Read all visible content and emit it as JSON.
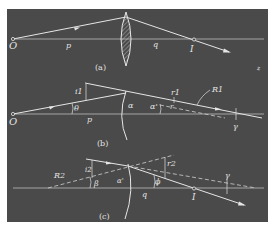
{
  "figure": {
    "background_color": "#4a4a4a",
    "page_color": "#ffffff",
    "line_color": "#e6e6e6",
    "panels": [
      {
        "id": "a",
        "caption": "(a)",
        "description": "Thin lens imaging an object point O to image point I on the optical axis",
        "labels": {
          "object": "O",
          "object_distance": "p",
          "image_distance": "q",
          "image": "I",
          "stray_mark": "z"
        }
      },
      {
        "id": "b",
        "caption": "(b)",
        "description": "Refraction at the first spherical surface of radius R1",
        "labels": {
          "object": "O",
          "object_distance": "p",
          "incidence_angle": "i1",
          "refraction_angle": "r1",
          "ray_angle": "θ",
          "surface_angle": "α",
          "normal_angle": "α'",
          "chief_angle": "r",
          "radius": "R1",
          "center_angle": "γ"
        }
      },
      {
        "id": "c",
        "caption": "(c)",
        "description": "Refraction at the second spherical surface of radius R2",
        "labels": {
          "radius": "R2",
          "incidence_angle": "i2",
          "refraction_angle": "r2",
          "ray_angle": "β",
          "surface_angle": "α'",
          "exit_angle": "ϕ",
          "image_distance": "q",
          "image": "I",
          "center_angle": "γ"
        }
      }
    ]
  }
}
